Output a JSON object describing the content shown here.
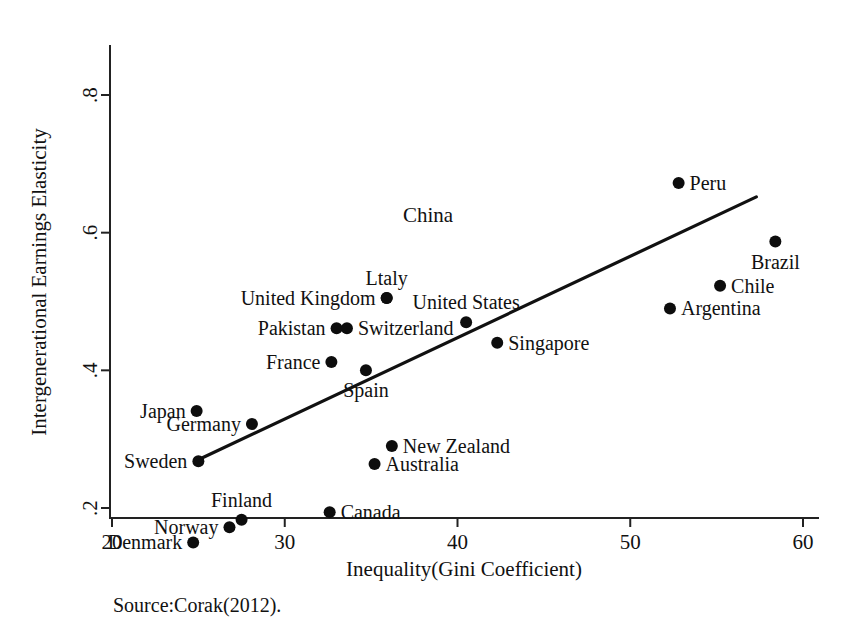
{
  "chart_data": {
    "type": "scatter",
    "title": "",
    "xlabel": "Inequality(Gini Coefficient)",
    "ylabel": "Intergenerational Earnings Elasticity",
    "xlim": [
      20,
      60
    ],
    "ylim": [
      0.13,
      0.82
    ],
    "xticks": [
      "20",
      "30",
      "40",
      "50",
      "60"
    ],
    "xtick_values": [
      20,
      30,
      40,
      50,
      60
    ],
    "yticks": [
      ".2",
      ".4",
      ".6",
      ".8"
    ],
    "ytick_values": [
      0.2,
      0.4,
      0.6,
      0.8
    ],
    "grid": false,
    "legend": "none",
    "source_note": "Source:Corak(2012).",
    "points": [
      {
        "label": "Denmark",
        "x": 24.7,
        "y": 0.15,
        "label_side": "left"
      },
      {
        "label": "Norway",
        "x": 26.8,
        "y": 0.172,
        "label_side": "left"
      },
      {
        "label": "Finland",
        "x": 27.5,
        "y": 0.183,
        "label_side": "above"
      },
      {
        "label": "Sweden",
        "x": 25.0,
        "y": 0.268,
        "label_side": "left"
      },
      {
        "label": "Japan",
        "x": 24.9,
        "y": 0.341,
        "label_side": "left"
      },
      {
        "label": "Germany",
        "x": 28.1,
        "y": 0.322,
        "label_side": "left"
      },
      {
        "label": "Canada",
        "x": 32.6,
        "y": 0.194,
        "label_side": "right"
      },
      {
        "label": "Australia",
        "x": 35.2,
        "y": 0.264,
        "label_side": "right"
      },
      {
        "label": "New Zealand",
        "x": 36.2,
        "y": 0.29,
        "label_side": "right"
      },
      {
        "label": "France",
        "x": 32.7,
        "y": 0.412,
        "label_side": "left"
      },
      {
        "label": "Spain",
        "x": 34.7,
        "y": 0.4,
        "label_side": "below"
      },
      {
        "label": "Pakistan",
        "x": 33.0,
        "y": 0.461,
        "label_side": "left"
      },
      {
        "label": "Switzerland",
        "x": 33.6,
        "y": 0.461,
        "label_side": "right"
      },
      {
        "label": "United Kingdom",
        "x": 35.9,
        "y": 0.505,
        "label_side": "left"
      },
      {
        "label": "Ltaly",
        "x": 35.9,
        "y": 0.505,
        "label_side": "above"
      },
      {
        "label": "United States",
        "x": 40.5,
        "y": 0.47,
        "label_side": "above"
      },
      {
        "label": "Singapore",
        "x": 42.3,
        "y": 0.44,
        "label_side": "right"
      },
      {
        "label": "Argentina",
        "x": 52.3,
        "y": 0.49,
        "label_side": "right"
      },
      {
        "label": "Chile",
        "x": 55.2,
        "y": 0.523,
        "label_side": "right"
      },
      {
        "label": "Peru",
        "x": 52.8,
        "y": 0.672,
        "label_side": "right"
      },
      {
        "label": "Brazil",
        "x": 58.4,
        "y": 0.587,
        "label_side": "below"
      }
    ],
    "unmarked_labels": [
      {
        "label": "China",
        "x": 38.3,
        "y": 0.615
      }
    ],
    "trend_line": {
      "x_start": 24.9,
      "y_start": 0.269,
      "x_end": 57.3,
      "y_end": 0.652
    }
  }
}
